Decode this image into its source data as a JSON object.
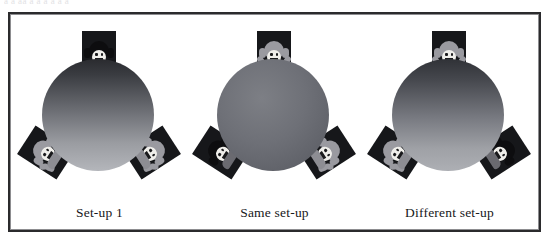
{
  "top_cut_text": "a a aa a a a a a a",
  "figure": {
    "background": "#ffffff",
    "frame_color": "#2b2b2d",
    "panels": [
      {
        "id": "panel-setup-1",
        "caption": "Set-up 1",
        "sphere": {
          "style": "grad-dark-light",
          "colors": [
            "#2a2b2f",
            "#b4b6bb"
          ],
          "description": "sphere shaded dark at top to light at bottom"
        },
        "cards": [
          {
            "position": "top",
            "doll": "dark",
            "rotation_deg": 0
          },
          {
            "position": "left",
            "doll": "light",
            "rotation_deg": -57
          },
          {
            "position": "right",
            "doll": "light",
            "rotation_deg": 57
          }
        ]
      },
      {
        "id": "panel-same-setup",
        "caption": "Same set-up",
        "sphere": {
          "style": "flat-grey",
          "colors": [
            "#7d7f85",
            "#55575d"
          ],
          "description": "sphere evenly shaded mid grey"
        },
        "cards": [
          {
            "position": "top",
            "doll": "light",
            "rotation_deg": 0
          },
          {
            "position": "left",
            "doll": "dark",
            "rotation_deg": -57
          },
          {
            "position": "right",
            "doll": "light",
            "rotation_deg": 57
          }
        ]
      },
      {
        "id": "panel-different-setup",
        "caption": "Different set-up",
        "sphere": {
          "style": "grad-mid",
          "colors": [
            "#303237",
            "#adafb4"
          ],
          "description": "sphere shaded dark at top to light at bottom"
        },
        "cards": [
          {
            "position": "top",
            "doll": "light",
            "rotation_deg": 0
          },
          {
            "position": "left",
            "doll": "light",
            "rotation_deg": -57
          },
          {
            "position": "right",
            "doll": "dark",
            "rotation_deg": 57
          }
        ]
      }
    ]
  }
}
